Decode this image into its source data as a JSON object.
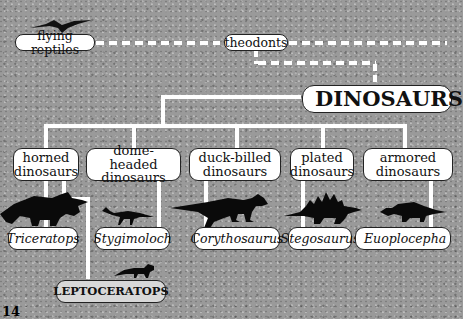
{
  "diagram": {
    "ancestors": {
      "flying_reptiles": "flying reptiles",
      "theodonts": "theodonts"
    },
    "root": "DINOSAURS",
    "groups": [
      {
        "label_line1": "horned",
        "label_line2": "dinosaurs",
        "example": "Triceratops"
      },
      {
        "label_line1": "dome-headed",
        "label_line2": "dinosaurs",
        "example": "Stygimoloch"
      },
      {
        "label_line1": "duck-billed",
        "label_line2": "dinosaurs",
        "example": "Corythosaurus"
      },
      {
        "label_line1": "plated",
        "label_line2": "dinosaurs",
        "example": "Stegosaurus"
      },
      {
        "label_line1": "armored",
        "label_line2": "dinosaurs",
        "example": "Euoplocepha"
      }
    ],
    "extra_example": "LEPTOCERATOPS",
    "page_number": "14"
  }
}
